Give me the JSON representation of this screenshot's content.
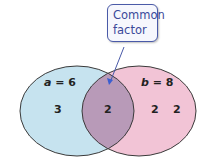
{
  "callout": {
    "line1": "Common",
    "line2": "factor"
  },
  "set_a": {
    "var": "a",
    "eq": " = 6",
    "elements": [
      "3"
    ],
    "color": "#c6e3ef"
  },
  "set_b": {
    "var": "b",
    "eq": " = 8",
    "elements": [
      "2",
      "2"
    ],
    "color": "#f2c4d6"
  },
  "intersection": {
    "elements": [
      "2"
    ],
    "color": "#b89ab8"
  },
  "colors": {
    "outline": "#3a3a3a",
    "callout_border": "#4a5aa8",
    "callout_text": "#3b4a9a",
    "arrow": "#3b5fd0"
  }
}
